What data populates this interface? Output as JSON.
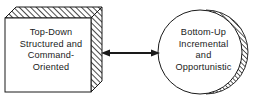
{
  "diagram": {
    "background_color": "#ffffff",
    "line_color": "#1a1a1a",
    "hatch_color": "#333333",
    "fill_color": "#ffffff",
    "nodes": [
      {
        "id": "top-down-box",
        "shape": "3d-box",
        "label": "Top-Down\nStructured and\nCommand-\nOriented",
        "lines": [
          "Top-Down",
          "Structured and",
          "Command-",
          "Oriented"
        ],
        "hatched_faces": [
          "top",
          "right"
        ],
        "x": 5,
        "y": 7,
        "width": 86,
        "height": 85,
        "depth": 11
      },
      {
        "id": "bottom-up-circle",
        "shape": "circle-with-shadow",
        "label": "Bottom-Up\nIncremental\nand\nOpportunistic",
        "lines": [
          "Bottom-Up",
          "Incremental",
          "and",
          "Opportunistic"
        ],
        "hatched_faces": [
          "right-crescent"
        ],
        "center_x": 202,
        "center_y": 52,
        "radius": 42
      }
    ],
    "connectors": [
      {
        "id": "bidirectional-arrow",
        "type": "double-headed-arrow",
        "from": "top-down-box",
        "to": "bottom-up-circle",
        "x1": 102,
        "x2": 160,
        "y": 53,
        "label": ""
      }
    ]
  }
}
